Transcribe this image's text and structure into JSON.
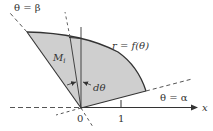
{
  "diagram": {
    "type": "polar-area-element",
    "colors": {
      "region_fill": "#cfcfcf",
      "line": "#333333",
      "dashed": "#555555",
      "background": "#ffffff"
    },
    "labels": {
      "theta_beta": "θ = β",
      "theta_alpha": "θ = α",
      "curve": "r = f(θ)",
      "point_M": "M",
      "point_M_sub": "i",
      "dtheta": "dθ",
      "origin": "0",
      "tick_one": "1",
      "x_axis": "x"
    }
  }
}
